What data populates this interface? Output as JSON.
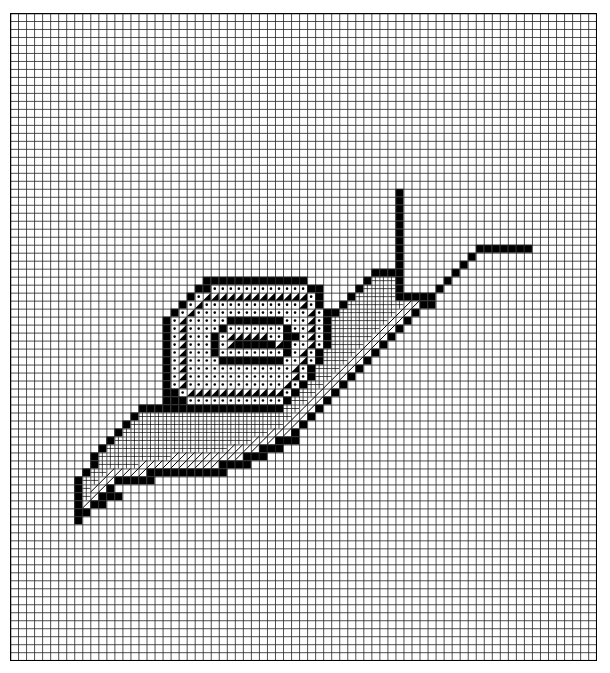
{
  "title": "Snail cross-stitch chart",
  "grid": {
    "cols": 73,
    "rows": 81,
    "cell_w": 8.03,
    "cell_h": 7.99,
    "line_color": "#222222",
    "border_color": "#000000",
    "bg_color": "#ffffff"
  },
  "legend": {
    ".": "empty",
    "B": "solid-black",
    "D": "dot",
    "T": "half-triangle",
    "H": "fine-hatch",
    "S": "diagonal-stripe"
  },
  "pattern": [
    ".........................................................................",
    ".........................................................................",
    ".........................................................................",
    ".........................................................................",
    ".........................................................................",
    ".........................................................................",
    ".........................................................................",
    ".........................................................................",
    ".........................................................................",
    ".........................................................................",
    ".........................................................................",
    ".........................................................................",
    ".........................................................................",
    ".........................................................................",
    ".........................................................................",
    ".........................................................................",
    ".........................................................................",
    ".........................................................................",
    ".........................................................................",
    ".........................................................................",
    ".........................................................................",
    ".........................................................................",
    "................................................B........................",
    "................................................B........................",
    "................................................B........................",
    "................................................B........................",
    "................................................B........................",
    "................................................B........................",
    "................................................B........................",
    "................................................B.........BBBBBBB........",
    "................................................B........B...............",
    "................................................B.......B................",
    ".............................................BBBB......B.................",
    "........................BBBBBBBBBBBBB.......BHHHB.....B..................",
    ".......................BBDDDDDDDDDDDDBB....BHHHHB....B...................",
    "......................BDTTTTTTTTTTTTTDB...BHHHHHBBBBB....................",
    ".....................BDTDDDDDDDDDDDDTDB..BHHHHHHHSSBB....................",
    "....................BDTDDDDDDDDDDDDDDTDBBHHHHHHHSSB......................",
    "...................BDTDDDDDBBBBBBBDDDTDBHHHHHHHSSB.......................",
    "...................BDTDDDDBDDDDDDDBDDTDBHHHHHHSSB........................",
    "...................BDTDDDBDTTTTTDDBBDTDBHHHHHSSB.........................",
    "...................BDTDDDBDTBBBBBTBDDTDBHHHHSSB..........................",
    "...................BDTDDDBDDDDDDDDBDTDBHHHHSSB...........................",
    "...................BDTDDDDBBBBBBBBDDTDBHHHSSB............................",
    "...................BDTDDDDDDDDDDDDDTDBHHHSSB.............................",
    "...................BDTDDDDDDDDDDDDDTDBHHSSB..............................",
    "...................BDTDDDDDDDDDDDDTDBHHSSB...............................",
    "...................BBDTTTTTTTTTTTTDBHHSSB................................",
    "...................BBBDDDDDDDDDDDDBHHSSB.................................",
    "................BBBBBBBBBBBBBBBBBBHHSSB..................................",
    "...............BHHHHHHHHHHHHHHHHHHHSSB...................................",
    "..............BHHHHHHHHHHHHHHHHHHHSSB....................................",
    ".............BHHHHHHHHHHHHHHHHHHSSSB.....................................",
    "............BHHHHHHHHHHHHHHHHHSSSBBB.....................................",
    "...........BHHHHHHHHHHHHHHHSSSSBBB.......................................",
    "..........BHHHHHHHHHSSSSSSSSSBBB.........................................",
    "..........BHHHHHSSSSSSSSSSBBBB...........................................",
    ".........BHHSSSSSBBBBBBBBBB..............................................",
    "........BHHSSBBBBB.......................................................",
    "........BHSSB............................................................",
    "........BHSBBB...........................................................",
    "........BSBB.............................................................",
    "........BB...............................................................",
    "........B................................................................",
    ".........................................................................",
    ".........................................................................",
    ".........................................................................",
    ".........................................................................",
    ".........................................................................",
    ".........................................................................",
    ".........................................................................",
    ".........................................................................",
    ".........................................................................",
    ".........................................................................",
    ".........................................................................",
    ".........................................................................",
    ".........................................................................",
    ".........................................................................",
    ".........................................................................",
    ".........................................................................",
    "........................................................................."
  ]
}
